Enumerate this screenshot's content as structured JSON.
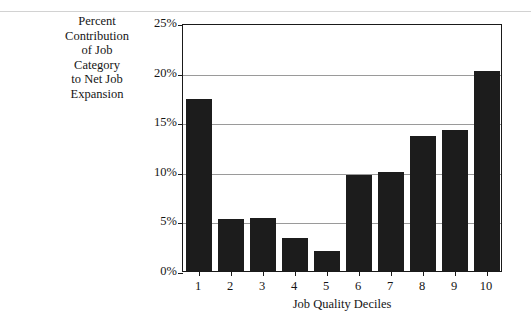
{
  "figure": {
    "y_axis_caption_lines": [
      "Percent",
      "Contribution",
      "of Job",
      "Category",
      "to Net Job",
      "Expansion"
    ],
    "x_axis_title": "Job Quality Deciles",
    "colors": {
      "bar": "#1c1c1c",
      "gridline": "#9a9a9a",
      "axis": "#1a1a1a",
      "background": "#ffffff",
      "text": "#151515"
    }
  },
  "chart_data": {
    "type": "bar",
    "title": "",
    "xlabel": "Job Quality Deciles",
    "ylabel": "Percent Contribution of Job Category to Net Job Expansion",
    "categories": [
      "1",
      "2",
      "3",
      "4",
      "5",
      "6",
      "7",
      "8",
      "9",
      "10"
    ],
    "values": [
      17.3,
      5.2,
      5.3,
      3.3,
      2.0,
      9.7,
      10.0,
      13.6,
      14.2,
      20.2
    ],
    "ylim": [
      0,
      25
    ],
    "ytick_values": [
      0,
      5,
      10,
      15,
      20,
      25
    ],
    "ytick_labels": [
      "0%",
      "5%",
      "10%",
      "15%",
      "20%",
      "25%"
    ],
    "grid": true,
    "grid_axis": "y",
    "legend": false
  }
}
